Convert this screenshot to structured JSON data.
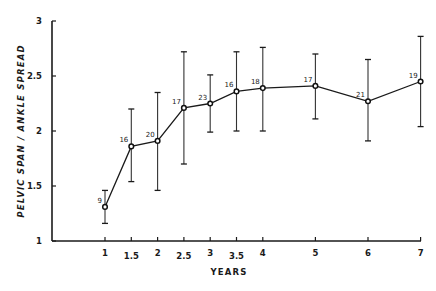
{
  "chart_data": {
    "type": "line",
    "title": "",
    "xlabel": "YEARS",
    "ylabel": "PELVIC SPAN / ANKLE SPREAD",
    "xlim": [
      0,
      7
    ],
    "ylim": [
      1,
      3
    ],
    "grid": false,
    "legend": null,
    "x_ticks": [
      1,
      1.5,
      2,
      2.5,
      3,
      3.5,
      4,
      5,
      6,
      7
    ],
    "x_tick_labels": [
      "1",
      "1.5",
      "2",
      "2.5",
      "3",
      "3.5",
      "4",
      "5",
      "6",
      "7"
    ],
    "y_ticks": [
      1,
      1.5,
      2,
      2.5,
      3
    ],
    "y_tick_labels": [
      "1",
      "1.5",
      "2",
      "2.5",
      "3"
    ],
    "series": [
      {
        "name": "Pelvic span / ankle spread",
        "x": [
          1,
          1.5,
          2,
          2.5,
          3,
          3.5,
          4,
          5,
          6,
          7
        ],
        "values": [
          1.31,
          1.86,
          1.91,
          2.21,
          2.25,
          2.36,
          2.39,
          2.41,
          2.27,
          2.45
        ],
        "error_upper": [
          1.46,
          2.2,
          2.35,
          2.72,
          2.51,
          2.72,
          2.76,
          2.7,
          2.65,
          2.86
        ],
        "error_lower": [
          1.16,
          1.54,
          1.46,
          1.7,
          1.99,
          2.0,
          2.0,
          2.11,
          1.91,
          2.04
        ],
        "n": [
          "9",
          "16",
          "20",
          "17",
          "23",
          "16",
          "18",
          "17",
          "21",
          "19"
        ],
        "marker": "open-circle"
      }
    ]
  },
  "colors": {
    "ink": "#1a1a1a",
    "background": "#ffffff"
  }
}
